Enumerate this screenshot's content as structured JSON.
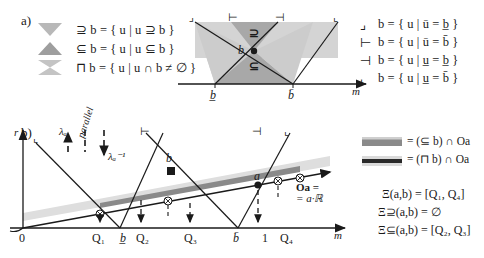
{
  "figure": {
    "panel_a_label": "a)",
    "panel_b_label": "b)"
  },
  "panel_a": {
    "icon_legend": [
      {
        "icon": "down-triangle-icon",
        "shape": "triangle-down",
        "text_prefix": "⊇",
        "text": "⊇ b = { u | u ⊇ b }"
      },
      {
        "icon": "up-triangle-icon",
        "shape": "triangle-up",
        "text_prefix": "⊆",
        "text": "⊆ b = { u | u ⊆ b }"
      },
      {
        "icon": "hourglass-icon",
        "shape": "hourglass",
        "text_prefix": "⊓",
        "text": "⊓ b = { u | u ∩ b ≠ ∅ }"
      }
    ],
    "corner_legend": [
      {
        "icon": "corner-top-left-icon",
        "text": "b = { u | ū = b̲ }"
      },
      {
        "icon": "corner-bottom-left-icon",
        "text": "b = { u | ū = b̄ }"
      },
      {
        "icon": "corner-top-right-icon",
        "text": "b = { u | u̲ = b̲ }"
      },
      {
        "icon": "corner-bottom-right-icon",
        "text": "b = { u | u̲ = b̄ }"
      }
    ],
    "diagram": {
      "axis_label": "m",
      "point_label": "b",
      "upper_cone_label": "⊇",
      "lower_cone_label": "⊆",
      "tick_left": "b̲",
      "tick_right": "b̄"
    }
  },
  "panel_b": {
    "axis": {
      "y_label": "r",
      "x_label": "m"
    },
    "x_ticks": [
      "0",
      "Q₁",
      "b̲",
      "Q₂",
      "Q₃",
      "b̄",
      "1",
      "Q₄"
    ],
    "annotations": {
      "lambda_up": "λₐ",
      "parallel": "parallel",
      "lambda_down": "λₐ⁻¹",
      "point_b": "b",
      "point_a": "a",
      "oa_line_1": "Oa =",
      "oa_line_2": "= a·ℝ"
    },
    "legend": [
      {
        "swatch": "dark-band-swatch",
        "text": "= (⊆ b) ∩ Oa"
      },
      {
        "swatch": "light-band-swatch",
        "text": "= (⊓ b) ∩ Oa"
      }
    ],
    "equations": [
      "Ξ(a,b) = [Q₁, Q₄]",
      "Ξ⊇(a,b) = ∅",
      "Ξ⊆(a,b) = [Q₂, Q₃]"
    ]
  },
  "colors": {
    "ink": "#1a1a1a",
    "cone_light": "#d4d4d4",
    "cone_mid": "#bdbdbd",
    "cone_dark": "#9e9e9e",
    "band_dark": "#808080",
    "band_light": "#d9d9d9",
    "icon_grey": "#b0b0b0"
  }
}
